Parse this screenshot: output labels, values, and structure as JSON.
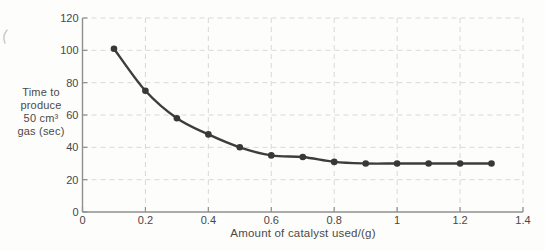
{
  "figure": {
    "y_axis_title_lines": [
      "Time to",
      "produce",
      "50 cm³",
      "gas (sec)"
    ]
  },
  "chart_data": {
    "type": "line",
    "title": "",
    "xlabel": "Amount of catalyst used/(g)",
    "ylabel": "Time to produce 50 cm³ gas (sec)",
    "x": [
      0.1,
      0.2,
      0.3,
      0.4,
      0.5,
      0.6,
      0.7,
      0.8,
      0.9,
      1.0,
      1.1,
      1.2,
      1.3
    ],
    "values": [
      101,
      75,
      58,
      48,
      40,
      35,
      34,
      31,
      30,
      30,
      30,
      30,
      30
    ],
    "xlim": [
      0,
      1.4
    ],
    "ylim": [
      0,
      120
    ],
    "x_ticks": [
      {
        "value": 0,
        "label": "0"
      },
      {
        "value": 0.2,
        "label": "0.2"
      },
      {
        "value": 0.4,
        "label": "0.4"
      },
      {
        "value": 0.6,
        "label": "0.6"
      },
      {
        "value": 0.8,
        "label": "0.8"
      },
      {
        "value": 1.0,
        "label": "1"
      },
      {
        "value": 1.2,
        "label": "1.2"
      },
      {
        "value": 1.4,
        "label": "1.4"
      }
    ],
    "y_ticks": [
      {
        "value": 0,
        "label": "0"
      },
      {
        "value": 20,
        "label": "20"
      },
      {
        "value": 40,
        "label": "40"
      },
      {
        "value": 60,
        "label": "60"
      },
      {
        "value": 80,
        "label": "80"
      },
      {
        "value": 100,
        "label": "100"
      },
      {
        "value": 120,
        "label": "120"
      }
    ],
    "grid": "dashed-both-axes",
    "legend": "none",
    "marker": "filled-circle",
    "colors": {
      "line": "#3d3d3d",
      "marker": "#383838",
      "grid": "#d9d9d9",
      "axis": "#8f8f8f",
      "text": "#474747"
    }
  }
}
